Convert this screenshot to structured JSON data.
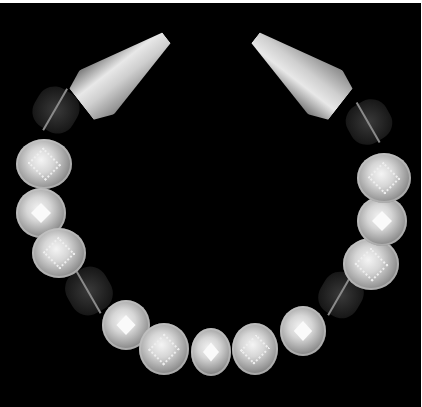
{
  "image": {
    "subject": "gold granulated bead necklace on black background",
    "background_color": "#000000",
    "border_color": "#ffffff",
    "elements": {
      "end_caps": 2,
      "spacer_beads_dark": 4,
      "round_beads": 11
    }
  }
}
